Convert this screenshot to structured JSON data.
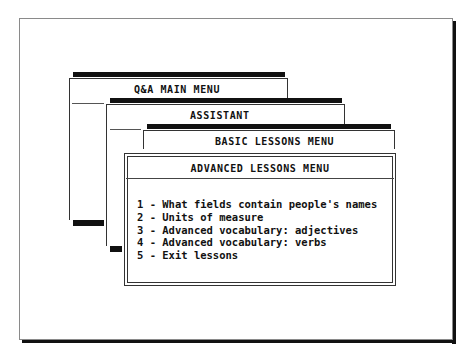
{
  "screen": {
    "frame_color": "#8a8a8a",
    "shadow_color": "#111111",
    "background": "#ffffff"
  },
  "windows": {
    "main_menu": {
      "title": "Q&A MAIN MENU"
    },
    "assistant": {
      "title": "ASSISTANT"
    },
    "basic_lessons": {
      "title": "BASIC LESSONS MENU"
    },
    "advanced_lessons": {
      "title": "ADVANCED LESSONS MENU",
      "items": [
        {
          "label": "1 - What fields contain people's names"
        },
        {
          "label": "2 - Units of measure"
        },
        {
          "label": "3 - Advanced vocabulary: adjectives"
        },
        {
          "label": "4 - Advanced vocabulary: verbs"
        },
        {
          "label": "5 - Exit lessons"
        }
      ]
    }
  }
}
